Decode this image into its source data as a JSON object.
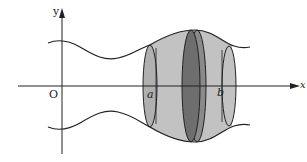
{
  "diagram": {
    "labels": {
      "y_axis": "y",
      "x_axis": "x",
      "origin": "O",
      "a": "a",
      "b": "b"
    },
    "colors": {
      "light_fill": "#c2c2c2",
      "disk_fill": "#6e6e6e",
      "stroke": "#222222"
    }
  }
}
